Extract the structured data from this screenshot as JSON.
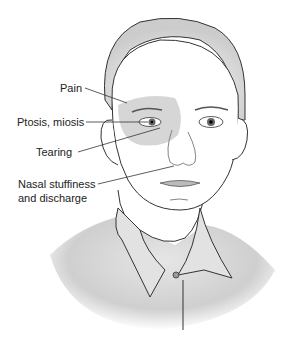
{
  "figure": {
    "labels": [
      {
        "id": "pain",
        "text": "Pain"
      },
      {
        "id": "ptosis",
        "text": "Ptosis, miosis"
      },
      {
        "id": "tearing",
        "text": "Tearing"
      },
      {
        "id": "nasal1",
        "text": "Nasal stuffiness"
      },
      {
        "id": "nasal2",
        "text": "and discharge"
      }
    ],
    "colors": {
      "shaded_region": "#cfcfcf",
      "line": "#333333",
      "skin": "#ffffff",
      "shirt": "#d8d8d8"
    }
  }
}
